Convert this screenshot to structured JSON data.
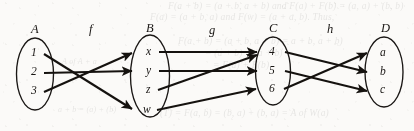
{
  "figure": {
    "kind": "function-composition-diagram",
    "background_color": "#fbfaf8",
    "ink_color": "#15120f"
  },
  "sets": [
    {
      "id": "A",
      "label": "A",
      "cx": 35,
      "cy": 74,
      "rx": 18.5,
      "ry": 36,
      "members": [
        {
          "label": "1",
          "x": 31,
          "y": 56
        },
        {
          "label": "2",
          "x": 31,
          "y": 75
        },
        {
          "label": "3",
          "x": 31,
          "y": 94
        }
      ]
    },
    {
      "id": "B",
      "label": "B",
      "cx": 150,
      "cy": 76,
      "rx": 19.5,
      "ry": 41,
      "members": [
        {
          "label": "x",
          "x": 146,
          "y": 55
        },
        {
          "label": "y",
          "x": 146,
          "y": 74
        },
        {
          "label": "z",
          "x": 146,
          "y": 93
        },
        {
          "label": "w",
          "x": 144,
          "y": 112
        }
      ]
    },
    {
      "id": "C",
      "label": "C",
      "cx": 273,
      "cy": 71,
      "rx": 17.5,
      "ry": 34,
      "members": [
        {
          "label": "4",
          "x": 269,
          "y": 55
        },
        {
          "label": "5",
          "x": 269,
          "y": 74
        },
        {
          "label": "6",
          "x": 269,
          "y": 92
        }
      ]
    },
    {
      "id": "D",
      "label": "D",
      "cx": 384,
      "cy": 72,
      "rx": 19,
      "ry": 35,
      "members": [
        {
          "label": "a",
          "x": 380,
          "y": 56
        },
        {
          "label": "b",
          "x": 380,
          "y": 75
        },
        {
          "label": "c",
          "x": 380,
          "y": 93
        }
      ]
    }
  ],
  "set_labels": [
    {
      "id": "label-A",
      "text": "A",
      "x": 31,
      "y": 33
    },
    {
      "id": "label-B",
      "text": "B",
      "x": 146,
      "y": 32
    },
    {
      "id": "label-C",
      "text": "C",
      "x": 269,
      "y": 32
    },
    {
      "id": "label-D",
      "text": "D",
      "x": 381,
      "y": 32
    }
  ],
  "function_labels": [
    {
      "id": "label-f",
      "text": "f",
      "x": 89,
      "y": 33
    },
    {
      "id": "label-g",
      "text": "g",
      "x": 209,
      "y": 34
    },
    {
      "id": "label-h",
      "text": "h",
      "x": 327,
      "y": 33
    }
  ],
  "mappings": {
    "f": {
      "name": "f",
      "domain": "A",
      "codomain": "B",
      "pairs": [
        {
          "from": "1",
          "to": "w",
          "x1": 44,
          "y1": 54,
          "x2": 132,
          "y2": 109
        },
        {
          "from": "2",
          "to": "y",
          "x1": 44,
          "y1": 73,
          "x2": 132,
          "y2": 71
        },
        {
          "from": "3",
          "to": "x",
          "x1": 44,
          "y1": 92,
          "x2": 132,
          "y2": 53
        }
      ]
    },
    "g": {
      "name": "g",
      "domain": "B",
      "codomain": "C",
      "pairs": [
        {
          "from": "x",
          "to": "4",
          "x1": 159,
          "y1": 52,
          "x2": 257,
          "y2": 52
        },
        {
          "from": "y",
          "to": "5",
          "x1": 159,
          "y1": 71,
          "x2": 257,
          "y2": 71
        },
        {
          "from": "z",
          "to": "4",
          "x1": 158,
          "y1": 90,
          "x2": 257,
          "y2": 55
        },
        {
          "from": "w",
          "to": "6",
          "x1": 157,
          "y1": 110,
          "x2": 256,
          "y2": 89
        }
      ]
    },
    "h": {
      "name": "h",
      "domain": "C",
      "codomain": "D",
      "pairs": [
        {
          "from": "4",
          "to": "b",
          "x1": 285,
          "y1": 52,
          "x2": 367,
          "y2": 72
        },
        {
          "from": "5",
          "to": "c",
          "x1": 285,
          "y1": 71,
          "x2": 367,
          "y2": 91
        },
        {
          "from": "6",
          "to": "a",
          "x1": 284,
          "y1": 89,
          "x2": 367,
          "y2": 53
        }
      ]
    }
  },
  "bleed_through": {
    "note": "faint show-through of printing on the reverse side of the page; mostly illegible",
    "lines": [
      {
        "text": "F(a + b) = (a + b, a + b)   and   F(a) + F(b) = (a, a) + (b, b)",
        "x": 168,
        "y": 9
      },
      {
        "text": "F(a) = (a + b, a) and F(w) = (a + a, b).  Thus,",
        "x": 150,
        "y": 20
      },
      {
        "text": "F(a + b) = (a + b, a + b) = a + b, a + b)",
        "x": 178,
        "y": 44
      },
      {
        "text": "= (a + b) + (a + b)",
        "x": 205,
        "y": 56
      },
      {
        "text": "= F(a) + F(b)",
        "x": 213,
        "y": 68
      },
      {
        "text": "(T) = F(a, b) = (b, a) + (b, a) = A of W(a)",
        "x": 160,
        "y": 116
      },
      {
        "text": "a + b = (a) + (b)",
        "x": 58,
        "y": 112
      },
      {
        "text": "A of A + a",
        "x": 62,
        "y": 64
      }
    ]
  }
}
